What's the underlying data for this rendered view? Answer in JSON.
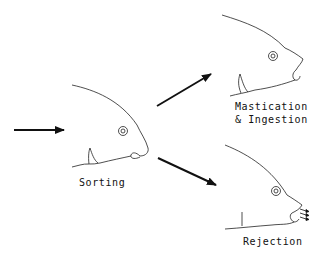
{
  "diagram": {
    "type": "feeding-behavior-flow",
    "nodes": [
      {
        "id": "sorting",
        "label": "Sorting",
        "icon": "fish-head-closed-mouth-icon"
      },
      {
        "id": "mastication",
        "label_line1": "Mastication",
        "label_line2": "& Ingestion",
        "icon": "fish-head-open-mouth-icon"
      },
      {
        "id": "rejection",
        "label": "Rejection",
        "icon": "fish-head-expelling-icon"
      }
    ],
    "edges": [
      {
        "from": "input",
        "to": "sorting"
      },
      {
        "from": "sorting",
        "to": "mastication"
      },
      {
        "from": "sorting",
        "to": "rejection"
      }
    ],
    "colors": {
      "stroke": "#111111",
      "background": "#ffffff"
    }
  }
}
